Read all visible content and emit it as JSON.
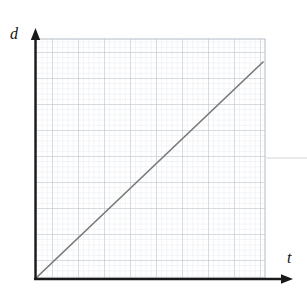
{
  "figure": {
    "kind": "line-graph-on-graph-paper",
    "width": 307,
    "height": 295,
    "background": "#ffffff"
  },
  "labels": {
    "y_axis": "d",
    "x_axis": "t"
  },
  "colors": {
    "axis": "#1a1a1a",
    "plot_line": "#7a7a7a",
    "grid_minor": "#d9dee6",
    "grid_major": "#b9c0ca",
    "grid_border": "#aab0ba",
    "artifact": "#cfcfcf",
    "background": "#ffffff"
  },
  "geometry": {
    "plot_left": 36,
    "plot_top": 39,
    "plot_right": 265,
    "plot_bottom": 278,
    "origin_x": 36,
    "origin_y": 278,
    "y_axis_x": 35,
    "y_axis_top": 30,
    "y_axis_bottom": 280,
    "x_axis_y": 279,
    "x_axis_left": 35,
    "x_axis_right": 291,
    "minor_step": 5.2,
    "major_every": 5,
    "artifact_y": 158,
    "artifact_x_start": 266,
    "artifact_x_end": 307
  },
  "chart_data": {
    "type": "line",
    "title": "",
    "xlabel": "t",
    "ylabel": "d",
    "grid": true,
    "grid_style": "graph-paper minor 1 unit, major every 5 units",
    "legend": "none",
    "xlim": [
      0,
      44
    ],
    "ylim": [
      0,
      46
    ],
    "x_ticks": [
      0,
      5,
      10,
      15,
      20,
      25,
      30,
      35,
      40
    ],
    "y_ticks": [
      0,
      5,
      10,
      15,
      20,
      25,
      30,
      35,
      40,
      45
    ],
    "x_tick_labels": [
      "",
      "",
      "",
      "",
      "",
      "",
      "",
      "",
      ""
    ],
    "y_tick_labels": [
      "",
      "",
      "",
      "",
      "",
      "",
      "",
      "",
      "",
      ""
    ],
    "annotations": [],
    "series": [
      {
        "name": "distance vs time",
        "color": "#7a7a7a",
        "relationship": "directly proportional (straight line through the origin)",
        "slope": 1,
        "intercept": 0,
        "x": [
          0,
          43.7
        ],
        "y": [
          0,
          41.5
        ],
        "points_px": [
          [
            36,
            278
          ],
          [
            263,
            62
          ]
        ]
      }
    ]
  },
  "elements": {
    "y_axis_name": "vertical-axis-arrow",
    "x_axis_name": "horizontal-axis-arrow",
    "line_name": "proportional-line",
    "artifact_name": "scan-artifact-line"
  }
}
